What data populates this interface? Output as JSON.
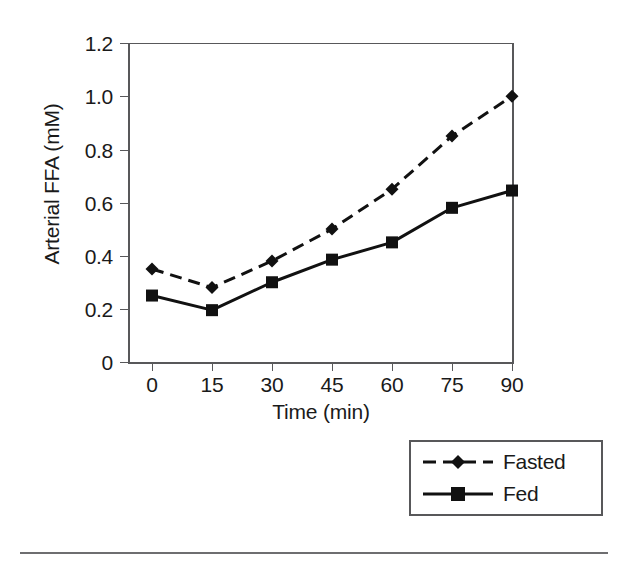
{
  "chart_data": {
    "type": "line",
    "title": "",
    "xlabel": "Time (min)",
    "ylabel": "Arterial FFA (mM)",
    "categories": [
      "0",
      "15",
      "30",
      "45",
      "60",
      "75",
      "90"
    ],
    "x": [
      0,
      15,
      30,
      45,
      60,
      75,
      90
    ],
    "xlim": [
      0,
      90
    ],
    "ylim": [
      0,
      1.2
    ],
    "yticks": [
      "0",
      "0.2",
      "0.4",
      "0.6",
      "0.8",
      "1.0",
      "1.2"
    ],
    "ytick_values": [
      0,
      0.2,
      0.4,
      0.6,
      0.8,
      1.0,
      1.2
    ],
    "xticks": [
      "0",
      "15",
      "30",
      "45",
      "60",
      "75",
      "90"
    ],
    "grid": false,
    "legend_position": "bottom-right",
    "series": [
      {
        "name": "Fasted",
        "values": [
          0.35,
          0.28,
          0.38,
          0.5,
          0.65,
          0.85,
          1.0
        ],
        "line_style": "dashed",
        "marker": "diamond",
        "color": "#111111"
      },
      {
        "name": "Fed",
        "values": [
          0.25,
          0.195,
          0.3,
          0.385,
          0.45,
          0.58,
          0.645
        ],
        "line_style": "solid",
        "marker": "square",
        "color": "#111111"
      }
    ]
  },
  "legend": {
    "entries": [
      {
        "label": "Fasted",
        "marker": "diamond-icon",
        "line_style": "dashed"
      },
      {
        "label": "Fed",
        "marker": "square-icon",
        "line_style": "solid"
      }
    ]
  },
  "axes": {
    "y_title": "Arterial FFA (mM)",
    "x_title": "Time (min)",
    "y_tick_labels": [
      "1.2",
      "1.0",
      "0.8",
      "0.6",
      "0.4",
      "0.2",
      "0"
    ],
    "x_tick_labels": [
      "0",
      "15",
      "30",
      "45",
      "60",
      "75",
      "90"
    ]
  },
  "colors": {
    "axis": "#58585a",
    "ink": "#111111",
    "rule": "#6e6e70",
    "background": "#ffffff"
  }
}
